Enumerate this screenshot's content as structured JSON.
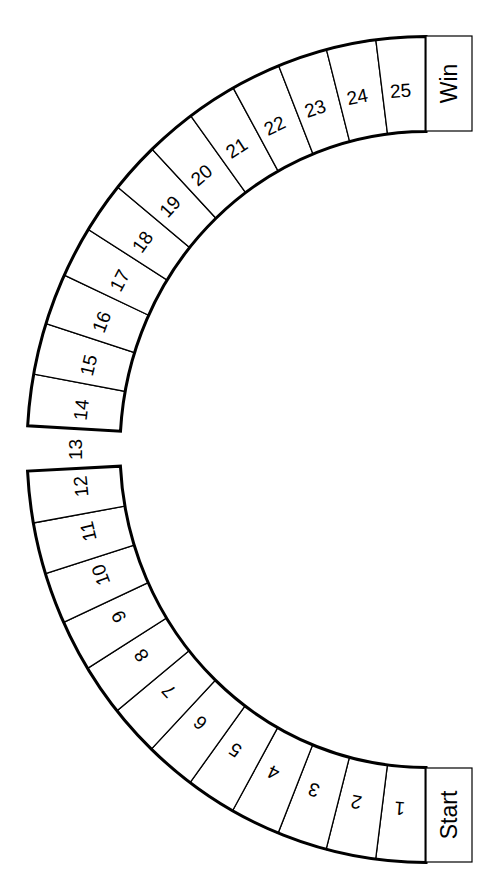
{
  "board": {
    "title": "",
    "colors": {
      "line": "#000000",
      "background": "#ffffff"
    },
    "geometry": {
      "cx": 426,
      "cy": 449.5,
      "outer_rx": 399,
      "outer_ry": 413,
      "inner_rx": 306,
      "inner_ry": 318
    },
    "start_box": {
      "label": "Start",
      "x": 426,
      "y": 768,
      "w": 46,
      "h": 94
    },
    "win_box": {
      "label": "Win",
      "x": 426,
      "y": 36,
      "w": 46,
      "h": 95
    },
    "bottom_arc": {
      "from_deg": 90,
      "to_deg": 177,
      "cells": [
        "1",
        "2",
        "3",
        "4",
        "5",
        "6",
        "7",
        "8",
        "9",
        "10",
        "11",
        "12"
      ]
    },
    "gap_label": {
      "label": "13",
      "deg": 180
    },
    "top_arc": {
      "from_deg": 183.3,
      "to_deg": 270,
      "cells": [
        "14",
        "15",
        "16",
        "17",
        "18",
        "19",
        "20",
        "21",
        "22",
        "23",
        "24",
        "25"
      ]
    }
  }
}
